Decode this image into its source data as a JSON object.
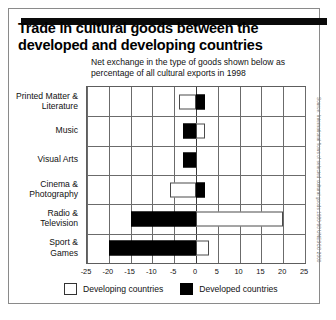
{
  "figure": {
    "title": "Trade in cultural goods between the developed and developing countries",
    "subtitle": "Net exchange in the type of goods shown below as percentage of all cultural exports in 1998",
    "source": "Source: International flows of selected cultural goods 1980-98 UNESCO 2000"
  },
  "legend": {
    "developing_label": "Developing countries",
    "developed_label": "Developed countries"
  },
  "colors": {
    "developed": "#000000",
    "developing": "#ffffff",
    "developing_border": "#4a4a4a",
    "grid": "#6b6b6b",
    "frame": "#8a8a8a",
    "rule": "#0a0a0a"
  },
  "chart_data": {
    "type": "bar",
    "orientation": "horizontal",
    "title": "Trade in cultural goods between the developed and developing countries",
    "subtitle": "Net exchange in the type of goods shown below as percentage of all cultural exports in 1998",
    "xlabel": "",
    "ylabel": "",
    "xlim": [
      -25,
      25
    ],
    "xticks": [
      -25,
      -20,
      -15,
      -10,
      -5,
      0,
      5,
      10,
      15,
      20,
      25
    ],
    "xtick_labels": [
      "-25",
      "-20",
      "-15",
      "-10",
      "-5",
      "0",
      "5",
      "10",
      "15",
      "20",
      "25"
    ],
    "grid": true,
    "legend_position": "bottom",
    "categories": [
      "Printed Matter & Literature",
      "Music",
      "Visual Arts",
      "Cinema & Photography",
      "Radio & Television",
      "Sport & Games"
    ],
    "series": [
      {
        "name": "Developing countries",
        "values": [
          -4,
          2,
          0,
          -6,
          20,
          3
        ]
      },
      {
        "name": "Developed countries",
        "values": [
          2,
          -3,
          -3,
          2,
          -15,
          -20
        ]
      }
    ]
  }
}
